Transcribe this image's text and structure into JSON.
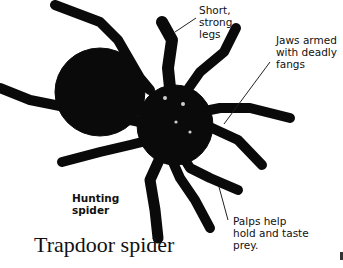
{
  "figure": {
    "title": "Trapdoor spider",
    "labels": [
      {
        "id": "legs",
        "text": "Short,\nstrong\nlegs"
      },
      {
        "id": "jaws",
        "text": "Jaws armed\nwith deadly\nfangs"
      },
      {
        "id": "hunting",
        "text": "Hunting\nspider"
      },
      {
        "id": "palps",
        "text": "Palps help\nhold and taste\nprey."
      }
    ]
  }
}
